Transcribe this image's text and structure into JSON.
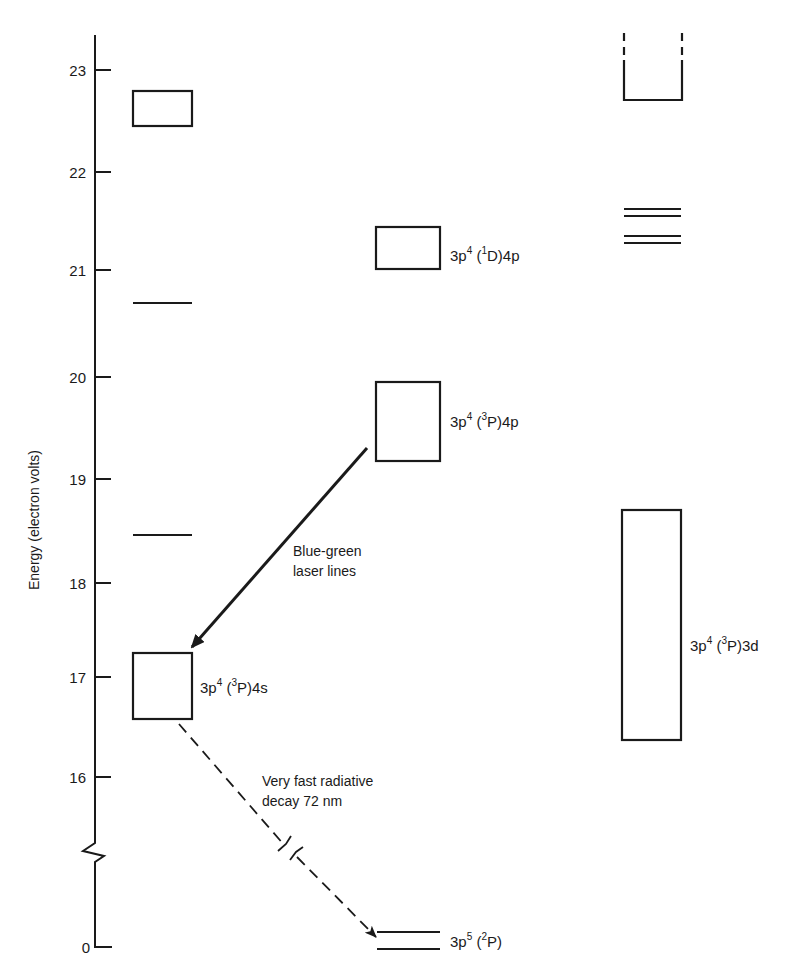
{
  "diagram": {
    "type": "energy-level-diagram",
    "top_clipped_text": "…",
    "axis": {
      "title": "Energy (electron volts)",
      "ticks": [
        {
          "label": "23",
          "y": 70
        },
        {
          "label": "22",
          "y": 172
        },
        {
          "label": "21",
          "y": 270
        },
        {
          "label": "20",
          "y": 377
        },
        {
          "label": "19",
          "y": 479
        },
        {
          "label": "18",
          "y": 583
        },
        {
          "label": "17",
          "y": 677
        },
        {
          "label": "16",
          "y": 777
        },
        {
          "label": "0",
          "y": 947
        }
      ],
      "break_between": [
        "16",
        "0"
      ]
    },
    "levels": {
      "col1_box_top": {
        "energy_range_eV": [
          22.45,
          22.8
        ]
      },
      "col1_line_a": {
        "energy_eV": 20.7
      },
      "col1_line_b": {
        "energy_eV": 18.45
      },
      "ar_4s": {
        "label_main": "3p",
        "label_sup1": "4",
        "label_paren_open": " (",
        "label_sup2": "3",
        "label_rest": "P)4s",
        "energy_range_eV": [
          16.6,
          17.25
        ]
      },
      "ar_1D_4p": {
        "label_main": "3p",
        "label_sup1": "4",
        "label_paren_open": " (",
        "label_sup2": "1",
        "label_rest": "D)4p",
        "energy_range_eV": [
          21.0,
          21.45
        ]
      },
      "ar_3P_4p": {
        "label_main": "3p",
        "label_sup1": "4",
        "label_paren_open": " (",
        "label_sup2": "3",
        "label_rest": "P)4p",
        "energy_range_eV": [
          19.2,
          19.95
        ]
      },
      "ar_3d": {
        "label_main": "3p",
        "label_sup1": "4",
        "label_paren_open": " (",
        "label_sup2": "3",
        "label_rest": "P)3d",
        "energy_range_eV": [
          16.35,
          18.7
        ]
      },
      "col3_open_top": {
        "energy_bottom_eV": 22.7
      },
      "col3_lines": {
        "energies_eV": [
          21.6,
          21.55,
          21.35,
          21.27
        ]
      },
      "ground": {
        "label_main": "3p",
        "label_sup1": "5",
        "label_paren_open": " (",
        "label_sup2": "2",
        "label_rest": "P)",
        "energy_eV": 0
      }
    },
    "transitions": {
      "laser": {
        "line1": "Blue-green",
        "line2": "laser lines",
        "from": "3p4(3P)4p",
        "to": "3p4(3P)4s",
        "style": "solid"
      },
      "decay": {
        "line1": "Very fast radiative",
        "line2": "decay 72 nm",
        "from": "3p4(3P)4s",
        "to": "3p5(2P)",
        "style": "dashed"
      }
    }
  }
}
